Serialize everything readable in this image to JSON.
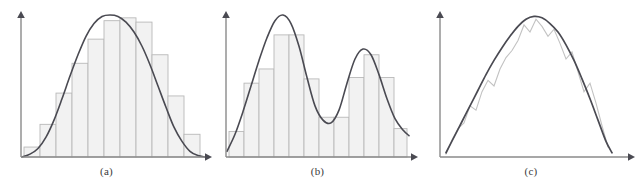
{
  "figure": {
    "width": 638,
    "height": 195,
    "background": "#ffffff",
    "curve_color": "#4a4a52",
    "bar_fill": "#f2f2f2",
    "bar_stroke": "#b9b9b9",
    "axis_color": "#8a8a8a",
    "rough_color": "#c2c2c2",
    "caption_color": "#3a3a3a"
  },
  "panels": [
    {
      "id": "a",
      "caption": "(a)",
      "axes": {
        "origin_x": 21,
        "origin_y": 157,
        "y_top": 15,
        "x_right": 205,
        "x_label": "",
        "y_label": ""
      },
      "chart_data": {
        "type": "bar",
        "title": "",
        "xlabel": "",
        "ylabel": "",
        "grid": false,
        "legend": "none",
        "xlim": [
          0,
          11
        ],
        "ylim": [
          0,
          1
        ],
        "categories": [
          "1",
          "2",
          "3",
          "4",
          "5",
          "6",
          "7",
          "8",
          "9",
          "10",
          "11"
        ],
        "bin_edges": [
          24,
          40,
          56,
          72,
          88,
          104,
          120,
          136,
          152,
          168,
          184,
          200
        ],
        "values": [
          0.07,
          0.23,
          0.45,
          0.66,
          0.83,
          0.96,
          0.98,
          0.95,
          0.72,
          0.43,
          0.16
        ],
        "overlay": {
          "type": "line",
          "name": "smooth density estimate",
          "x": [
            22,
            30,
            38,
            46,
            54,
            62,
            70,
            78,
            86,
            94,
            102,
            110,
            118,
            126,
            134,
            142,
            150,
            158,
            166,
            174,
            182,
            190,
            198,
            205
          ],
          "y": [
            0.0,
            0.02,
            0.06,
            0.14,
            0.26,
            0.41,
            0.57,
            0.72,
            0.85,
            0.94,
            0.99,
            1.0,
            0.99,
            0.95,
            0.88,
            0.78,
            0.65,
            0.5,
            0.35,
            0.21,
            0.11,
            0.04,
            0.01,
            0.0
          ]
        }
      }
    },
    {
      "id": "b",
      "caption": "(b)",
      "axes": {
        "origin_x": 15,
        "origin_y": 157,
        "y_top": 15,
        "x_right": 200,
        "x_label": "",
        "y_label": ""
      },
      "chart_data": {
        "type": "bar",
        "title": "",
        "xlabel": "",
        "ylabel": "",
        "grid": false,
        "legend": "none",
        "xlim": [
          0,
          12
        ],
        "ylim": [
          0,
          1
        ],
        "categories": [
          "1",
          "2",
          "3",
          "4",
          "5",
          "6",
          "7",
          "8",
          "9",
          "10",
          "11",
          "12"
        ],
        "bin_edges": [
          18,
          33,
          48,
          63,
          78,
          93,
          108,
          123,
          138,
          153,
          168,
          183,
          196
        ],
        "values": [
          0.18,
          0.52,
          0.62,
          0.86,
          0.86,
          0.55,
          0.28,
          0.28,
          0.56,
          0.72,
          0.56,
          0.2
        ],
        "overlay": {
          "type": "line",
          "name": "smooth density estimate",
          "x": [
            16,
            24,
            32,
            40,
            48,
            56,
            64,
            72,
            80,
            88,
            96,
            104,
            112,
            120,
            128,
            136,
            144,
            152,
            160,
            168,
            176,
            184,
            192,
            198
          ],
          "y": [
            0.04,
            0.16,
            0.32,
            0.5,
            0.68,
            0.84,
            0.96,
            1.0,
            0.94,
            0.78,
            0.56,
            0.36,
            0.26,
            0.24,
            0.33,
            0.52,
            0.69,
            0.76,
            0.72,
            0.58,
            0.41,
            0.27,
            0.19,
            0.15
          ]
        }
      }
    },
    {
      "id": "c",
      "caption": "(c)",
      "axes": {
        "origin_x": 16,
        "origin_y": 157,
        "y_top": 15,
        "x_right": 204,
        "x_label": "",
        "y_label": ""
      },
      "chart_data": {
        "type": "line",
        "title": "",
        "xlabel": "",
        "ylabel": "",
        "grid": false,
        "legend": "none",
        "xlim": [
          0,
          1
        ],
        "ylim": [
          0,
          1
        ],
        "series": [
          {
            "name": "rough (noisy) estimate",
            "color": "#c2c2c2",
            "x": [
              22,
              28,
              34,
              40,
              46,
              52,
              58,
              64,
              70,
              76,
              82,
              88,
              94,
              100,
              106,
              112,
              118,
              124,
              130,
              136,
              142,
              148,
              154,
              160,
              166,
              172,
              178,
              184
            ],
            "y": [
              0.02,
              0.12,
              0.2,
              0.24,
              0.36,
              0.33,
              0.46,
              0.54,
              0.5,
              0.62,
              0.7,
              0.75,
              0.82,
              0.93,
              0.88,
              0.97,
              0.92,
              0.85,
              0.9,
              0.8,
              0.69,
              0.74,
              0.6,
              0.46,
              0.52,
              0.38,
              0.22,
              0.07
            ]
          },
          {
            "name": "smooth density estimate",
            "color": "#4a4a52",
            "x": [
              22,
              30,
              38,
              46,
              54,
              62,
              70,
              78,
              86,
              94,
              102,
              110,
              118,
              126,
              134,
              142,
              150,
              158,
              166,
              174,
              182,
              188
            ],
            "y": [
              0.03,
              0.14,
              0.25,
              0.36,
              0.47,
              0.58,
              0.68,
              0.77,
              0.85,
              0.92,
              0.97,
              0.99,
              0.98,
              0.94,
              0.88,
              0.79,
              0.68,
              0.55,
              0.41,
              0.26,
              0.11,
              0.03
            ]
          }
        ]
      }
    }
  ]
}
